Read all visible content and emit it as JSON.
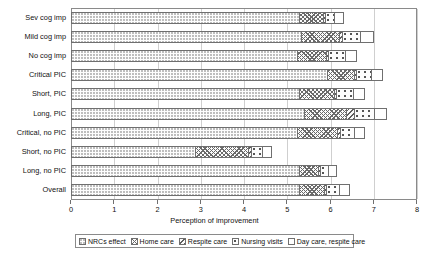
{
  "chart_data": {
    "type": "bar",
    "orientation": "horizontal",
    "stacked": true,
    "title": "",
    "xlabel": "Perception of improvement",
    "ylabel": "",
    "xlim": [
      0,
      8
    ],
    "xticks": [
      0,
      1,
      2,
      3,
      4,
      5,
      6,
      7,
      8
    ],
    "xtick_labels": [
      "0",
      "1",
      "2",
      "3",
      "4",
      "5",
      "6",
      "7",
      "8"
    ],
    "grid": true,
    "legend_position": "bottom",
    "categories": [
      "Sev cog imp",
      "Mild cog imp",
      "No cog imp",
      "Critical PIC",
      "Short, PIC",
      "Long, PIC",
      "Critical, no PIC",
      "Short, no PIC",
      "Long, no PIC",
      "Overall"
    ],
    "series": [
      {
        "name": "NRCs effect",
        "pattern": "fine-dot",
        "values": [
          5.3,
          5.35,
          5.25,
          5.95,
          5.3,
          5.4,
          5.25,
          2.9,
          5.3,
          5.3
        ]
      },
      {
        "name": "Home care",
        "pattern": "cross-hatch",
        "values": [
          0.58,
          0.9,
          0.7,
          0.65,
          0.82,
          1.0,
          0.95,
          1.25,
          0.45,
          0.6
        ]
      },
      {
        "name": "Respite care",
        "pattern": "diagonal-hatch",
        "values": [
          0.07,
          0.08,
          0.07,
          0.07,
          0.08,
          0.22,
          0.08,
          0.07,
          0.07,
          0.07
        ]
      },
      {
        "name": "Nursing visits",
        "pattern": "oval-dot",
        "values": [
          0.22,
          0.45,
          0.4,
          0.35,
          0.42,
          0.48,
          0.35,
          0.3,
          0.22,
          0.32
        ]
      },
      {
        "name": "Day care, respite care",
        "pattern": "sparse-dot",
        "values": [
          0.23,
          0.32,
          0.28,
          0.28,
          0.28,
          0.3,
          0.27,
          0.23,
          0.21,
          0.26
        ]
      }
    ],
    "totals": [
      6.4,
      7.1,
      6.7,
      7.3,
      6.9,
      7.4,
      6.9,
      4.75,
      6.25,
      6.55
    ]
  },
  "legend": {
    "items": [
      {
        "label": "NRCs effect"
      },
      {
        "label": "Home care"
      },
      {
        "label": "Respite care"
      },
      {
        "label": "Nursing visits"
      },
      {
        "label": "Day care, respite care"
      }
    ]
  }
}
